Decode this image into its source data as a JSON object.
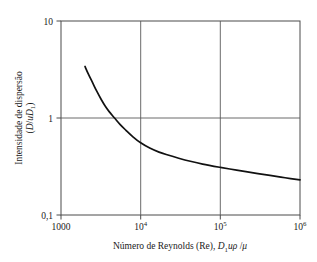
{
  "chart_data": {
    "type": "line",
    "title": "",
    "xlabel": "Número de Reynolds (Re), D₁uρ /μ",
    "ylabel": "Intensidade de dispersão (D/uD₁)",
    "xscale": "log",
    "yscale": "log",
    "xlim": [
      1000,
      1000000
    ],
    "ylim": [
      0.1,
      10
    ],
    "grid": true,
    "legend": null,
    "xticklabels": [
      "1000",
      "10⁴",
      "10⁵",
      "10⁶"
    ],
    "xtickvalues": [
      1000,
      10000,
      100000,
      1000000
    ],
    "yticklabels": [
      "10",
      "1",
      "0,1"
    ],
    "ytickvalues": [
      10,
      1,
      0.1
    ],
    "series": [
      {
        "name": "Intensidade de dispersão",
        "x": [
          2000,
          2200,
          2500,
          2800,
          3200,
          3600,
          4000,
          4700,
          5500,
          6500,
          8000,
          10000,
          13000,
          17000,
          22000,
          30000,
          42000,
          60000,
          100000,
          160000,
          260000,
          420000,
          650000,
          1000000
        ],
        "y": [
          3.4,
          2.85,
          2.3,
          1.9,
          1.55,
          1.32,
          1.17,
          1.0,
          0.86,
          0.75,
          0.64,
          0.555,
          0.49,
          0.445,
          0.415,
          0.385,
          0.358,
          0.335,
          0.31,
          0.29,
          0.272,
          0.256,
          0.242,
          0.23
        ]
      }
    ]
  },
  "labels": {
    "xaxis": {
      "lead": "Número de Reynolds (Re), ",
      "var_d": "D",
      "var_d_sub": "1",
      "var_urho": "uρ",
      "slash": " /",
      "var_mu": "μ"
    },
    "yaxis": {
      "line1": "Intensidade de dispersão",
      "line2_open": "(",
      "line2_d": "D",
      "line2_slash": "/",
      "line2_u": "u",
      "line2_d2": "D",
      "line2_sub": "1",
      "line2_close": ")"
    },
    "xticks": [
      "1000",
      "10",
      "10",
      "10"
    ],
    "xtick_exponents": [
      "",
      "4",
      "5",
      "6"
    ],
    "yticks": [
      "10",
      "1",
      "0,1"
    ]
  },
  "colors": {
    "curve": "#111111",
    "axis": "#4a4a4a",
    "grid": "#5a5a5a",
    "background": "#ffffff",
    "text": "#1a1a1a"
  }
}
